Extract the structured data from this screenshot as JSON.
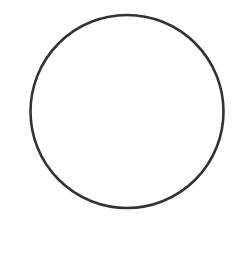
{
  "diagram": {
    "shape": "circle",
    "center_x": 127,
    "center_y": 111.5,
    "radius": 96.5,
    "stroke_color": "#333333",
    "stroke_width": 2.6,
    "fill_color": "none",
    "background_color": "#ffffff"
  }
}
